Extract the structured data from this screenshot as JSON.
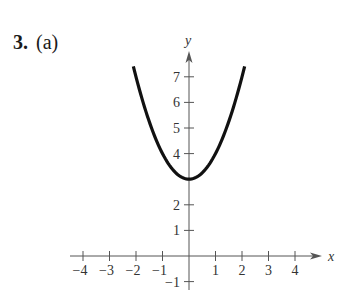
{
  "problem": {
    "number": "3.",
    "part": "(a)"
  },
  "chart_data": {
    "type": "line",
    "title": "",
    "function": "y = x^2 + 3",
    "xlabel": "x",
    "ylabel": "y",
    "xlim": [
      -4.5,
      5
    ],
    "ylim": [
      -1.5,
      8
    ],
    "x_ticks": [
      -4,
      -3,
      -2,
      -1,
      1,
      2,
      3,
      4
    ],
    "y_ticks": [
      -1,
      1,
      2,
      4,
      5,
      6,
      7
    ],
    "grid": false,
    "legend": null,
    "series": [
      {
        "name": "parabola",
        "x": [
          -2.1,
          -1.5,
          -1,
          -0.5,
          0,
          0.5,
          1,
          1.5,
          2.1
        ],
        "y": [
          7.41,
          5.25,
          4,
          3.25,
          3,
          3.25,
          4,
          5.25,
          7.41
        ]
      }
    ],
    "vertex": [
      0,
      3
    ]
  },
  "colors": {
    "curve": "#111111",
    "axis": "#555555",
    "text": "#333333"
  }
}
